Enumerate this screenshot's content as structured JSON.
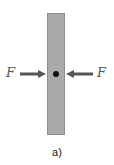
{
  "diagram": {
    "force_left_label": "F",
    "force_right_label": "F",
    "caption": "a)",
    "colors": {
      "bar_fill": "#a9a9a9",
      "bar_border": "#8e8e8e",
      "arrow": "#555555",
      "center_dot": "#111111",
      "label": "#555555"
    }
  }
}
